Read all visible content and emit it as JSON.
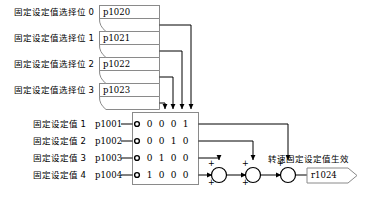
{
  "diagram": {
    "selector_bits": [
      {
        "label": "固定设定值选择位 0",
        "param": "p1020"
      },
      {
        "label": "固定设定值选择位 1",
        "param": "p1021"
      },
      {
        "label": "固定设定值选择位 2",
        "param": "p1022"
      },
      {
        "label": "固定设定值选择位 3",
        "param": "p1023"
      }
    ],
    "setpoints": [
      {
        "label": "固定设定值 1",
        "param": "p1001",
        "bits": [
          "0",
          "0",
          "0",
          "1"
        ]
      },
      {
        "label": "固定设定值 2",
        "param": "p1002",
        "bits": [
          "0",
          "0",
          "1",
          "0"
        ]
      },
      {
        "label": "固定设定值 3",
        "param": "p1003",
        "bits": [
          "0",
          "1",
          "0",
          "0"
        ]
      },
      {
        "label": "固定设定值 4",
        "param": "p1004",
        "bits": [
          "1",
          "0",
          "0",
          "0"
        ]
      }
    ],
    "adders": [
      {
        "name": "adder-1",
        "sign_top": "+",
        "sign_left": "+",
        "sign_bottom": "+"
      },
      {
        "name": "adder-2",
        "sign_top": "+",
        "sign_left": "+",
        "sign_bottom": "+"
      },
      {
        "name": "adder-3",
        "sign_top": "+",
        "sign_left": "+",
        "sign_bottom": "+"
      }
    ],
    "output": {
      "label": "转速固定设定值生效",
      "param": "r1024"
    },
    "colors": {
      "line": "#000000",
      "box_border": "#808080",
      "box_fill": "#ffffff",
      "background": "#ffffff",
      "text": "#000000"
    }
  }
}
